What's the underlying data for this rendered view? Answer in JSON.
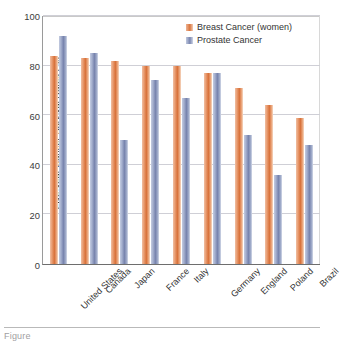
{
  "chart_data": {
    "type": "bar",
    "title": "",
    "xlabel": "",
    "ylabel": "Five-year Cancer Survival Rates (%)",
    "ylim": [
      0,
      100
    ],
    "yticks": [
      0,
      20,
      40,
      60,
      80,
      100
    ],
    "ytick_labels": [
      "0",
      "20",
      "40",
      "60",
      "80",
      "100"
    ],
    "grid": true,
    "legend_position": "top-right",
    "categories": [
      "United States",
      "Canada",
      "Japan",
      "France",
      "Italy",
      "Germany",
      "England",
      "Poland",
      "Brazil"
    ],
    "series": [
      {
        "name": "Breast Cancer (women)",
        "color": "#d8713a",
        "values": [
          84,
          83,
          82,
          80,
          80,
          77,
          71,
          64,
          59
        ]
      },
      {
        "name": "Prostate Cancer",
        "color": "#7783ad",
        "values": [
          92,
          85,
          50,
          74,
          67,
          77,
          52,
          36,
          48
        ]
      }
    ]
  },
  "legend": {
    "items": [
      {
        "label": "Breast Cancer (women)"
      },
      {
        "label": "Prostate Cancer"
      }
    ]
  },
  "caption": {
    "text": "Figure"
  }
}
